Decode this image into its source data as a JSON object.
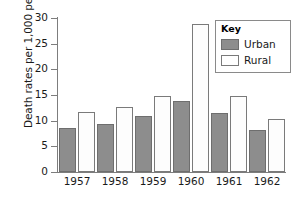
{
  "chart_data": {
    "type": "bar",
    "title": "",
    "xlabel": "",
    "ylabel": "Death rates per 1,000 people",
    "categories": [
      "1957",
      "1958",
      "1959",
      "1960",
      "1961",
      "1962"
    ],
    "series": [
      {
        "name": "Urban",
        "color": "#8d8d8d",
        "values": [
          8.5,
          9.3,
          11.0,
          13.9,
          11.5,
          8.2
        ]
      },
      {
        "name": "Rural",
        "color": "#ffffff",
        "values": [
          11.7,
          12.7,
          14.9,
          28.8,
          14.9,
          10.4
        ]
      }
    ],
    "ylim": [
      0,
      30
    ],
    "ytick_labels": [
      "0",
      "5",
      "10",
      "15",
      "20",
      "25",
      "30"
    ],
    "ytick_values": [
      0,
      5,
      10,
      15,
      20,
      25,
      30
    ],
    "grid": false,
    "legend": {
      "title": "Key",
      "position": "top-right",
      "entries": [
        {
          "label": "Urban",
          "swatch": "filled-gray"
        },
        {
          "label": "Rural",
          "swatch": "outlined-white"
        }
      ]
    }
  }
}
